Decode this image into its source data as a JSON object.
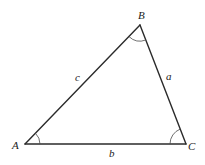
{
  "diagram": {
    "type": "triangle",
    "vertices": {
      "A": {
        "label": "A",
        "x": 25,
        "y": 144
      },
      "B": {
        "label": "B",
        "x": 140,
        "y": 25
      },
      "C": {
        "label": "C",
        "x": 186,
        "y": 144
      }
    },
    "sides": {
      "a": {
        "label": "a",
        "between": [
          "B",
          "C"
        ]
      },
      "b": {
        "label": "b",
        "between": [
          "A",
          "C"
        ]
      },
      "c": {
        "label": "c",
        "between": [
          "A",
          "B"
        ]
      }
    },
    "angle_marks": [
      "A",
      "B",
      "C"
    ],
    "colors": {
      "line": "#2b2b2b",
      "background": "#ffffff"
    }
  }
}
